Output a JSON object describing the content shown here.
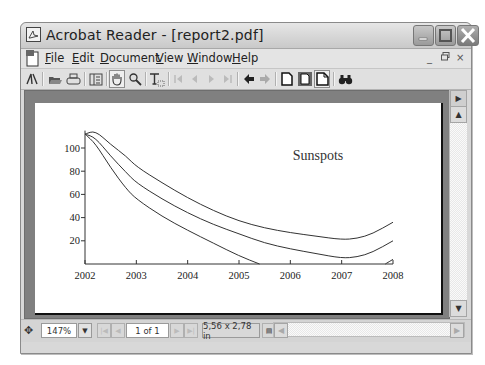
{
  "window": {
    "title": "Acrobat Reader - [report2.pdf]",
    "controls": {
      "minimize": "minimize",
      "maximize": "maximize",
      "close": "close"
    }
  },
  "menubar": {
    "items": [
      {
        "label": "File",
        "accel": "F"
      },
      {
        "label": "Edit",
        "accel": "E"
      },
      {
        "label": "Document",
        "accel": "D"
      },
      {
        "label": "View",
        "accel": "V"
      },
      {
        "label": "Window",
        "accel": "W"
      },
      {
        "label": "Help",
        "accel": "H"
      }
    ],
    "mdi_controls": [
      "_",
      "🗗",
      "×"
    ]
  },
  "toolbar": {
    "icons": [
      "acrobat-logo-icon",
      "open-icon",
      "print-icon",
      "show-hide-navigation-icon",
      "hand-tool-icon",
      "zoom-tool-icon",
      "text-select-icon",
      "first-page-icon",
      "previous-page-icon",
      "next-page-icon",
      "last-page-icon",
      "go-back-icon",
      "go-forward-icon",
      "actual-size-icon",
      "fit-page-icon",
      "fit-width-icon",
      "find-icon"
    ],
    "active_tool": "hand-tool-icon"
  },
  "statusbar": {
    "zoom": "147%",
    "page": "1 of 1",
    "page_size": "5,56 x 2,78 in"
  },
  "chart_data": {
    "type": "line",
    "title": "Sunspots",
    "xlabel": "",
    "ylabel": "",
    "x_ticks": [
      "2002",
      "2003",
      "2004",
      "2005",
      "2006",
      "2007",
      "2008"
    ],
    "y_ticks": [
      "20",
      "40",
      "60",
      "80",
      "100"
    ],
    "xlim": [
      2002,
      2008
    ],
    "ylim": [
      0,
      115
    ],
    "grid": false,
    "legend": null,
    "series": [
      {
        "name": "upper",
        "x": [
          2002.0,
          2002.2,
          2002.5,
          2002.8,
          2003.0,
          2003.5,
          2004.0,
          2004.5,
          2005.0,
          2005.5,
          2006.0,
          2006.5,
          2007.0,
          2007.3,
          2007.6,
          2008.0
        ],
        "values": [
          112,
          115,
          103,
          93,
          84,
          70,
          57,
          46,
          37,
          31,
          27,
          24,
          21,
          22,
          26,
          36
        ]
      },
      {
        "name": "middle",
        "x": [
          2002.0,
          2002.2,
          2002.5,
          2002.8,
          2003.0,
          2003.5,
          2004.0,
          2004.5,
          2005.0,
          2005.5,
          2006.0,
          2006.5,
          2007.0,
          2007.3,
          2007.6,
          2008.0
        ],
        "values": [
          112,
          109,
          93,
          79,
          70,
          56,
          44,
          34,
          26,
          18,
          13,
          9,
          5,
          6,
          10,
          20
        ]
      },
      {
        "name": "lower",
        "x": [
          2002.0,
          2002.2,
          2002.5,
          2002.8,
          2003.0,
          2003.5,
          2004.0,
          2004.5,
          2005.0,
          2005.4
        ],
        "values": [
          112,
          104,
          83,
          65,
          56,
          41,
          29,
          18,
          7,
          0
        ]
      },
      {
        "name": "lower-tail",
        "x": [
          2007.85,
          2008.0
        ],
        "values": [
          0,
          4
        ]
      }
    ]
  }
}
